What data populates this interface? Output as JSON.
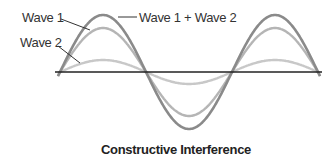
{
  "diagram": {
    "title": "Constructive Interference",
    "labels": {
      "wave1": "Wave 1",
      "wave2": "Wave 2",
      "sum": "Wave 1 + Wave 2"
    },
    "colors": {
      "sum": "#8a8a8a",
      "wave1": "#b5b5b5",
      "wave2": "#c8c8c8",
      "axis": "#222222",
      "leader": "#333333"
    },
    "axis": {
      "x_start": 55,
      "x_end": 322,
      "y": 72
    },
    "waves": [
      {
        "name": "sum",
        "amplitude": 57,
        "period": 172,
        "phase_x": 60
      },
      {
        "name": "wave1",
        "amplitude": 44,
        "period": 172,
        "phase_x": 60
      },
      {
        "name": "wave2",
        "amplitude": 12,
        "period": 172,
        "phase_x": 60
      }
    ]
  }
}
